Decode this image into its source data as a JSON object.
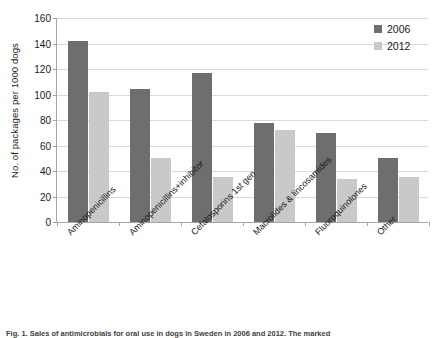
{
  "chart_data": {
    "type": "bar",
    "title": "",
    "xlabel": "",
    "ylabel": "No. of packages per 1000 dogs",
    "ylim": [
      0,
      160
    ],
    "ytick_step": 20,
    "yticks": [
      0,
      20,
      40,
      60,
      80,
      100,
      120,
      140,
      160
    ],
    "grid": true,
    "legend_position": "top-right",
    "categories": [
      "Aminopenicillins",
      "Aminopenicillins+inhibitor",
      "Cefalosporins 1st gen",
      "Macrolides & lincosamides",
      "Fluoroquinolones",
      "Other"
    ],
    "series": [
      {
        "name": "2006",
        "color": "#6e6e6e",
        "values": [
          142,
          104,
          117,
          78,
          69.5,
          50.5
        ]
      },
      {
        "name": "2012",
        "color": "#c9c9c9",
        "values": [
          102,
          50,
          35,
          72.5,
          34,
          35
        ]
      }
    ]
  },
  "legend": {
    "items": [
      {
        "label": "2006"
      },
      {
        "label": "2012"
      }
    ]
  },
  "caption": {
    "text": "Fig. 1. Sales of antimicrobials for oral use in dogs in Sweden in 2006 and 2012. The marked"
  }
}
